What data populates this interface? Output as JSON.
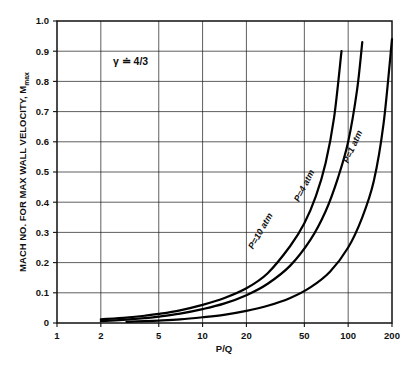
{
  "chart_data": {
    "type": "line",
    "title": "",
    "subtitle": "",
    "xlabel": "P/Q",
    "ylabel": "MACH NO. FOR MAX WALL VELOCITY, M",
    "ylabel_subscript": "max",
    "xscale": "log",
    "yscale": "linear",
    "xlim": [
      1,
      200
    ],
    "ylim": [
      0,
      1.0
    ],
    "grid": true,
    "legend_position": "inline-curve-labels",
    "annotations": [
      {
        "name": "gamma-annotation",
        "text": "γ ≐ 4/3",
        "x": 3.2,
        "y": 0.855
      }
    ],
    "xticks": [
      1,
      2,
      5,
      10,
      20,
      50,
      100,
      200
    ],
    "xticklabels": [
      "1",
      "2",
      "5",
      "10",
      "20",
      "50",
      "100",
      "200"
    ],
    "yticks": [
      0,
      0.1,
      0.2,
      0.3,
      0.4,
      0.5,
      0.6,
      0.7,
      0.8,
      0.9,
      1.0
    ],
    "yticklabels": [
      "0",
      "0.1",
      "0.2",
      "0.3",
      "0.4",
      "0.5",
      "0.6",
      "0.7",
      "0.8",
      "0.9",
      "1.0"
    ],
    "xgridlines": [
      2,
      5,
      10,
      20,
      50,
      100
    ],
    "ygridlines": [
      0.1,
      0.2,
      0.3,
      0.4,
      0.5,
      0.6,
      0.7,
      0.8,
      0.9
    ],
    "series": [
      {
        "name": "P=10 atm",
        "label": "P=10 atm",
        "color": "#000000",
        "x": [
          2,
          3,
          4,
          5,
          7,
          10,
          14,
          20,
          28,
          40,
          50,
          60,
          70,
          80,
          90
        ],
        "y": [
          0.012,
          0.018,
          0.024,
          0.03,
          0.042,
          0.06,
          0.082,
          0.115,
          0.165,
          0.255,
          0.33,
          0.42,
          0.53,
          0.68,
          0.9
        ]
      },
      {
        "name": "P=4 atm",
        "label": "P=4 atm",
        "color": "#000000",
        "x": [
          2,
          3,
          4,
          5,
          7,
          10,
          14,
          20,
          28,
          40,
          55,
          70,
          85,
          100,
          115,
          125
        ],
        "y": [
          0.006,
          0.011,
          0.016,
          0.021,
          0.031,
          0.046,
          0.064,
          0.092,
          0.13,
          0.19,
          0.275,
          0.37,
          0.48,
          0.6,
          0.77,
          0.93
        ]
      },
      {
        "name": "P=1 atm",
        "label": "P=1 atm",
        "color": "#000000",
        "x": [
          3,
          4,
          5,
          7,
          10,
          14,
          20,
          28,
          40,
          55,
          75,
          100,
          125,
          150,
          175,
          200
        ],
        "y": [
          0.004,
          0.006,
          0.008,
          0.012,
          0.019,
          0.027,
          0.04,
          0.057,
          0.083,
          0.118,
          0.17,
          0.25,
          0.35,
          0.47,
          0.66,
          0.94
        ]
      }
    ],
    "curve_labels": [
      {
        "name": "P=10 atm",
        "text": "P=10 atm",
        "x": 26,
        "y": 0.3,
        "rotation": -60
      },
      {
        "name": "P=4 atm",
        "text": "P=4 atm",
        "x": 52,
        "y": 0.45,
        "rotation": -63
      },
      {
        "name": "P=1 atm",
        "text": "P=1 atm",
        "x": 112,
        "y": 0.58,
        "rotation": -66
      }
    ]
  }
}
